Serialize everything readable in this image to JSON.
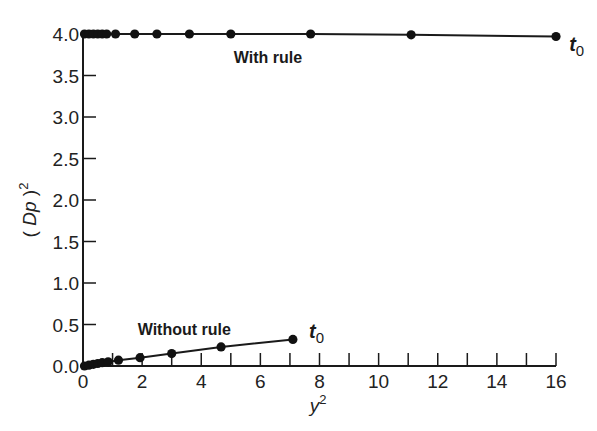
{
  "chart_data": {
    "type": "line",
    "title": "",
    "xlabel": "y²",
    "xlabel_base": "y",
    "xlabel_sup": "2",
    "ylabel": "(Dp)²",
    "ylabel_base": "(Dp)",
    "ylabel_sup": "2",
    "xlim": [
      0,
      16
    ],
    "ylim": [
      0.0,
      4.0
    ],
    "x_ticks": [
      0,
      2,
      4,
      6,
      8,
      10,
      12,
      14,
      16
    ],
    "x_tick_labels": [
      "0",
      "2",
      "4",
      "6",
      "8",
      "10",
      "12",
      "14",
      "16"
    ],
    "x_minor_ticks": [
      1,
      3,
      5,
      7,
      9,
      11,
      13,
      15
    ],
    "y_ticks": [
      0.0,
      0.5,
      1.0,
      1.5,
      2.0,
      2.5,
      3.0,
      3.5,
      4.0
    ],
    "y_tick_labels": [
      "0.0",
      "0.5",
      "1.0",
      "1.5",
      "2.0",
      "2.5",
      "3.0",
      "3.5",
      "4.0"
    ],
    "grid": false,
    "legend": null,
    "series": [
      {
        "name": "With rule",
        "label_position": {
          "x": 5.1,
          "y": 3.72
        },
        "end_annotation": "t0",
        "x": [
          0.05,
          0.2,
          0.35,
          0.5,
          0.65,
          0.8,
          1.1,
          1.75,
          2.5,
          3.6,
          5.0,
          7.7,
          11.1,
          16.0
        ],
        "y": [
          4.0,
          4.0,
          4.0,
          4.0,
          4.0,
          4.0,
          4.0,
          4.0,
          4.0,
          4.0,
          4.0,
          4.0,
          3.99,
          3.97
        ]
      },
      {
        "name": "Without rule",
        "label_position": {
          "x": 1.85,
          "y": 0.45
        },
        "end_annotation": "t0",
        "x": [
          0.05,
          0.2,
          0.35,
          0.5,
          0.65,
          0.85,
          1.2,
          1.93,
          3.0,
          4.67,
          7.1
        ],
        "y": [
          0.0,
          0.01,
          0.02,
          0.03,
          0.04,
          0.05,
          0.07,
          0.1,
          0.15,
          0.23,
          0.32
        ]
      }
    ],
    "annotations": [
      {
        "text": "With rule",
        "x": 5.1,
        "y": 3.72
      },
      {
        "text": "t0",
        "x": 16.7,
        "y": 3.88
      },
      {
        "text": "Without rule",
        "x": 1.85,
        "y": 0.45
      },
      {
        "text": "t0",
        "x": 7.9,
        "y": 0.42
      }
    ]
  },
  "labels": {
    "with_rule": "With rule",
    "without_rule": "Without rule",
    "t_base": "t",
    "t_sub": "0"
  }
}
